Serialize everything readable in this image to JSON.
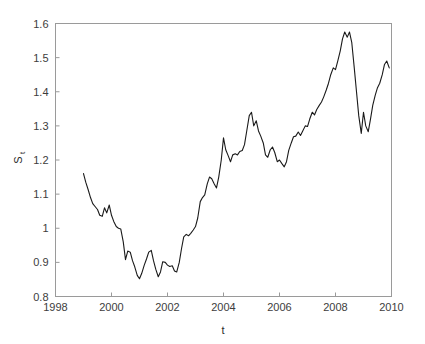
{
  "figure": {
    "background_color": "#ffffff",
    "axis_color": "#9a9a9a",
    "line_color": "#1a1a1a",
    "tick_label_color": "#3d3d3d"
  },
  "labels": {
    "ylabel_main": "S",
    "ylabel_sub": "t",
    "xlabel": "t"
  },
  "chart_data": {
    "type": "line",
    "title": "",
    "xlabel": "t",
    "ylabel": "S_t",
    "xlim": [
      1998,
      2010
    ],
    "ylim": [
      0.8,
      1.6
    ],
    "grid": false,
    "legend": null,
    "xticks": [
      1998,
      2000,
      2002,
      2004,
      2006,
      2008,
      2010
    ],
    "xtick_labels": [
      "1998",
      "2000",
      "2002",
      "2004",
      "2006",
      "2008",
      "2010"
    ],
    "yticks": [
      0.8,
      0.9,
      1.0,
      1.1,
      1.2,
      1.3,
      1.4,
      1.5,
      1.6
    ],
    "ytick_labels": [
      "0.8",
      "0.9",
      "1",
      "1.1",
      "1.2",
      "1.3",
      "1.4",
      "1.5",
      "1.6"
    ],
    "series": [
      {
        "name": "S_t",
        "color": "#1a1a1a",
        "x": [
          1999.0,
          1999.08,
          1999.17,
          1999.25,
          1999.33,
          1999.42,
          1999.5,
          1999.58,
          1999.67,
          1999.75,
          1999.83,
          1999.92,
          2000.0,
          2000.08,
          2000.17,
          2000.25,
          2000.33,
          2000.42,
          2000.5,
          2000.58,
          2000.67,
          2000.75,
          2000.83,
          2000.92,
          2001.0,
          2001.08,
          2001.17,
          2001.25,
          2001.33,
          2001.42,
          2001.5,
          2001.58,
          2001.67,
          2001.75,
          2001.83,
          2001.92,
          2002.0,
          2002.08,
          2002.17,
          2002.25,
          2002.33,
          2002.42,
          2002.5,
          2002.58,
          2002.67,
          2002.75,
          2002.83,
          2002.92,
          2003.0,
          2003.08,
          2003.17,
          2003.25,
          2003.33,
          2003.42,
          2003.5,
          2003.58,
          2003.67,
          2003.75,
          2003.83,
          2003.92,
          2004.0,
          2004.08,
          2004.17,
          2004.25,
          2004.33,
          2004.42,
          2004.5,
          2004.58,
          2004.67,
          2004.75,
          2004.83,
          2004.92,
          2005.0,
          2005.08,
          2005.17,
          2005.25,
          2005.33,
          2005.42,
          2005.5,
          2005.58,
          2005.67,
          2005.75,
          2005.83,
          2005.92,
          2006.0,
          2006.08,
          2006.17,
          2006.25,
          2006.33,
          2006.42,
          2006.5,
          2006.58,
          2006.67,
          2006.75,
          2006.83,
          2006.92,
          2007.0,
          2007.08,
          2007.17,
          2007.25,
          2007.33,
          2007.42,
          2007.5,
          2007.58,
          2007.67,
          2007.75,
          2007.83,
          2007.92,
          2008.0,
          2008.08,
          2008.17,
          2008.25,
          2008.33,
          2008.42,
          2008.5,
          2008.58,
          2008.67,
          2008.75,
          2008.83,
          2008.92,
          2009.0,
          2009.08,
          2009.17,
          2009.25,
          2009.33,
          2009.42,
          2009.5,
          2009.58,
          2009.67,
          2009.75,
          2009.83,
          2009.92
        ],
        "y": [
          1.16,
          1.135,
          1.112,
          1.09,
          1.072,
          1.063,
          1.055,
          1.038,
          1.035,
          1.06,
          1.045,
          1.068,
          1.038,
          1.02,
          1.005,
          1.0,
          0.998,
          0.96,
          0.908,
          0.933,
          0.93,
          0.905,
          0.887,
          0.862,
          0.852,
          0.868,
          0.892,
          0.91,
          0.93,
          0.935,
          0.905,
          0.88,
          0.858,
          0.872,
          0.902,
          0.9,
          0.892,
          0.888,
          0.89,
          0.875,
          0.872,
          0.9,
          0.94,
          0.975,
          0.982,
          0.978,
          0.985,
          0.995,
          1.005,
          1.03,
          1.078,
          1.09,
          1.098,
          1.13,
          1.15,
          1.145,
          1.13,
          1.118,
          1.15,
          1.2,
          1.265,
          1.23,
          1.212,
          1.195,
          1.215,
          1.218,
          1.215,
          1.225,
          1.228,
          1.245,
          1.285,
          1.33,
          1.34,
          1.3,
          1.315,
          1.285,
          1.27,
          1.25,
          1.215,
          1.208,
          1.23,
          1.238,
          1.222,
          1.195,
          1.2,
          1.19,
          1.18,
          1.195,
          1.228,
          1.25,
          1.268,
          1.27,
          1.282,
          1.272,
          1.285,
          1.3,
          1.298,
          1.32,
          1.34,
          1.332,
          1.348,
          1.36,
          1.37,
          1.385,
          1.405,
          1.425,
          1.45,
          1.47,
          1.465,
          1.49,
          1.52,
          1.555,
          1.575,
          1.56,
          1.575,
          1.545,
          1.47,
          1.4,
          1.33,
          1.278,
          1.34,
          1.3,
          1.283,
          1.32,
          1.36,
          1.39,
          1.412,
          1.425,
          1.45,
          1.48,
          1.49,
          1.47
        ]
      }
    ],
    "annotations": [
      {
        "label": "series start",
        "x": 1999.0,
        "y": 1.16
      },
      {
        "label": "minimum",
        "x": 2001.0,
        "y": 0.852
      },
      {
        "label": "maximum",
        "x": 2008.33,
        "y": 1.575
      },
      {
        "label": "series end",
        "x": 2009.92,
        "y": 1.47
      }
    ]
  }
}
